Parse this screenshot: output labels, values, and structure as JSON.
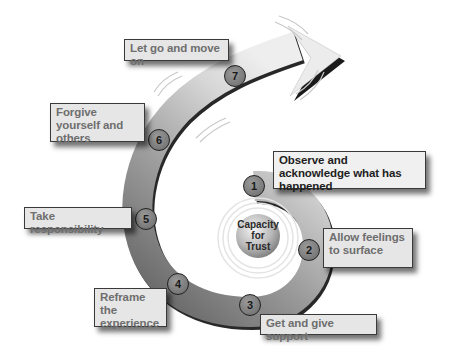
{
  "diagram": {
    "type": "spiral-process",
    "center": {
      "label_lines": [
        "Capacity",
        "for",
        "Trust"
      ]
    },
    "steps": [
      {
        "number": "1",
        "label": "Observe and acknowledge what has happened"
      },
      {
        "number": "2",
        "label": "Allow feelings to surface"
      },
      {
        "number": "3",
        "label": "Get and give support"
      },
      {
        "number": "4",
        "label": "Reframe the experience"
      },
      {
        "number": "5",
        "label": "Take responsibility"
      },
      {
        "number": "6",
        "label": "Forgive yourself and others"
      },
      {
        "number": "7",
        "label": "Let go and move on"
      }
    ],
    "colors": {
      "spiral_dark": "#6b6b6b",
      "spiral_light": "#d8d8d8",
      "box_fill": "#e6e6e6",
      "outline": "#1a1a1a"
    }
  }
}
